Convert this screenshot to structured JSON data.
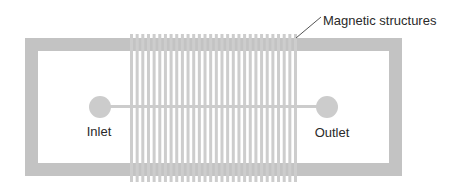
{
  "diagram": {
    "type": "microfluidic-chip-schematic",
    "labels": {
      "structures": "Magnetic structures",
      "inlet": "Inlet",
      "outlet": "Outlet"
    },
    "colors": {
      "frame": "#c3c3c3",
      "stripes": "#cdcdcd",
      "port": "#cccccc",
      "channel": "#cccccc",
      "text": "#2a2a2a",
      "leader": "#555555"
    },
    "stripe_count": 30
  }
}
